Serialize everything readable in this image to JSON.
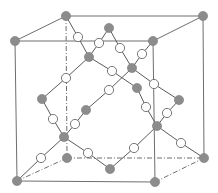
{
  "diagram": {
    "title": "",
    "colors": {
      "edge": "#6e6e6e",
      "bond": "#5a5a5a",
      "gray_atom": "#8c8c8c",
      "white_atom": "#ffffff"
    },
    "cube": {
      "front_top_left": [
        15,
        41
      ],
      "front_top_right": [
        153,
        41
      ],
      "front_bottom_left": [
        17,
        181
      ],
      "front_bottom_right": [
        155,
        182
      ],
      "back_top_left": [
        66,
        16
      ],
      "back_top_right": [
        203,
        16
      ],
      "back_bottom_left": [
        67,
        158
      ],
      "back_bottom_right": [
        204,
        158
      ]
    },
    "solid_edges": [
      [
        15,
        41,
        153,
        41
      ],
      [
        15,
        41,
        66,
        16
      ],
      [
        66,
        16,
        203,
        16
      ],
      [
        153,
        41,
        203,
        16
      ],
      [
        15,
        41,
        17,
        181
      ],
      [
        17,
        181,
        155,
        182
      ],
      [
        153,
        41,
        155,
        182
      ],
      [
        203,
        16,
        204,
        158
      ]
    ],
    "hidden_edges": [
      [
        66,
        16,
        67,
        158
      ],
      [
        67,
        158,
        204,
        158
      ],
      [
        17,
        181,
        67,
        158
      ],
      [
        155,
        182,
        204,
        158
      ]
    ],
    "bonds": [
      [
        66,
        16,
        78,
        37
      ],
      [
        78,
        37,
        89,
        57
      ],
      [
        89,
        57,
        99,
        43
      ],
      [
        99,
        43,
        109,
        28
      ],
      [
        109,
        28,
        120,
        48
      ],
      [
        120,
        48,
        132,
        68
      ],
      [
        132,
        68,
        142,
        54
      ],
      [
        142,
        54,
        153,
        41
      ],
      [
        89,
        57,
        112,
        71
      ],
      [
        112,
        71,
        137,
        88
      ],
      [
        89,
        57,
        66,
        78
      ],
      [
        66,
        78,
        42,
        99
      ],
      [
        132,
        68,
        109,
        90
      ],
      [
        109,
        90,
        86,
        110
      ],
      [
        132,
        68,
        154,
        84
      ],
      [
        154,
        84,
        179,
        100
      ],
      [
        42,
        99,
        53,
        119
      ],
      [
        53,
        119,
        64,
        137
      ],
      [
        86,
        110,
        75,
        124
      ],
      [
        75,
        124,
        64,
        137
      ],
      [
        137,
        88,
        146,
        107
      ],
      [
        146,
        107,
        157,
        126
      ],
      [
        179,
        100,
        167,
        113
      ],
      [
        167,
        113,
        157,
        126
      ],
      [
        64,
        137,
        41,
        158
      ],
      [
        41,
        158,
        17,
        181
      ],
      [
        64,
        137,
        88,
        153
      ],
      [
        88,
        153,
        110,
        169
      ],
      [
        157,
        126,
        134,
        148
      ],
      [
        134,
        148,
        110,
        169
      ],
      [
        157,
        126,
        181,
        143
      ],
      [
        181,
        143,
        204,
        158
      ]
    ],
    "gray_atoms": [
      [
        15,
        41
      ],
      [
        66,
        16
      ],
      [
        153,
        41
      ],
      [
        203,
        16
      ],
      [
        17,
        181
      ],
      [
        155,
        182
      ],
      [
        204,
        158
      ],
      [
        67,
        158
      ],
      [
        109,
        28
      ],
      [
        89,
        57
      ],
      [
        132,
        68
      ],
      [
        42,
        99
      ],
      [
        86,
        110
      ],
      [
        137,
        88
      ],
      [
        179,
        100
      ],
      [
        64,
        137
      ],
      [
        157,
        126
      ],
      [
        110,
        169
      ]
    ],
    "white_atoms": [
      [
        78,
        37
      ],
      [
        99,
        43
      ],
      [
        120,
        48
      ],
      [
        142,
        54
      ],
      [
        112,
        71
      ],
      [
        66,
        78
      ],
      [
        109,
        90
      ],
      [
        154,
        84
      ],
      [
        53,
        119
      ],
      [
        75,
        124
      ],
      [
        146,
        107
      ],
      [
        167,
        113
      ],
      [
        41,
        158
      ],
      [
        88,
        153
      ],
      [
        134,
        148
      ],
      [
        181,
        143
      ]
    ],
    "atom_radius": {
      "gray": 4.6,
      "white": 4.6
    }
  }
}
